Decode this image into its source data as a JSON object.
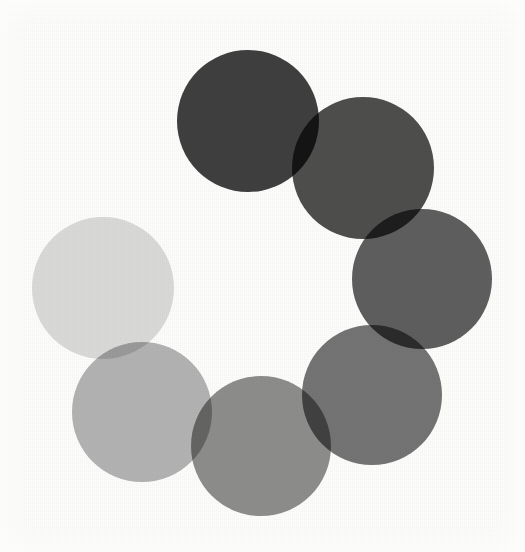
{
  "figure": {
    "background_color": "#fdfdfc",
    "blend_mode": "multiply",
    "canvas": {
      "width": 525,
      "height": 552
    }
  },
  "chart_data": {
    "type": "scatter",
    "xlabel": "",
    "ylabel": "",
    "xlim": [
      0,
      525
    ],
    "ylim": [
      0,
      552
    ],
    "grid": false,
    "legend_position": "none",
    "marker": "circle",
    "blend_mode": "multiply",
    "ring": {
      "center_x": 262,
      "center_y": 283,
      "ring_radius": 168,
      "circle_radius": 71,
      "count": 7
    },
    "categories": [
      "circle-1",
      "circle-2",
      "circle-3",
      "circle-4",
      "circle-5",
      "circle-6",
      "circle-7"
    ],
    "points": [
      {
        "label": "circle-1",
        "cx": 248,
        "cy": 121,
        "r": 71,
        "color": "#3f3f3f",
        "gray_value": 63,
        "angle_deg": 255,
        "order": 1
      },
      {
        "label": "circle-2",
        "cx": 363,
        "cy": 168,
        "r": 71,
        "color": "#4e4e4e",
        "gray_value": 78,
        "angle_deg": 300,
        "order": 2
      },
      {
        "label": "circle-3",
        "cx": 422,
        "cy": 279,
        "r": 70,
        "color": "#5f5f5f",
        "gray_value": 95,
        "angle_deg": 345,
        "order": 3
      },
      {
        "label": "circle-4",
        "cx": 372,
        "cy": 395,
        "r": 70,
        "color": "#757575",
        "gray_value": 117,
        "angle_deg": 35,
        "order": 4
      },
      {
        "label": "circle-5",
        "cx": 261,
        "cy": 446,
        "r": 70,
        "color": "#8e8e8e",
        "gray_value": 142,
        "angle_deg": 80,
        "order": 5
      },
      {
        "label": "circle-6",
        "cx": 142,
        "cy": 412,
        "r": 70,
        "color": "#b5b5b5",
        "gray_value": 181,
        "angle_deg": 125,
        "order": 6
      },
      {
        "label": "circle-7",
        "cx": 103,
        "cy": 288,
        "r": 71,
        "color": "#dcdcdc",
        "gray_value": 220,
        "angle_deg": 178,
        "order": 7
      }
    ],
    "values": [
      63,
      78,
      95,
      117,
      142,
      181,
      220
    ],
    "annotations": []
  }
}
